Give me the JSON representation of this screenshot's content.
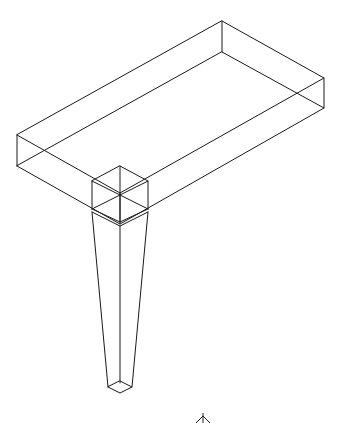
{
  "drawing": {
    "type": "isometric-wireframe",
    "subject": "table slab with tapered leg",
    "line_color": "#1a1a1a",
    "background": "#ffffff",
    "faint_label": "",
    "slab": {
      "top_face": [
        [
          222,
          21
        ],
        [
          324,
          78
        ],
        [
          120,
          193
        ],
        [
          17,
          135
        ]
      ],
      "bottom_face": [
        [
          222,
          52
        ],
        [
          324,
          108
        ],
        [
          120,
          224
        ],
        [
          17,
          166
        ]
      ]
    },
    "leg_block": {
      "top_face": [
        [
          120,
          166
        ],
        [
          148,
          181
        ],
        [
          120,
          195
        ],
        [
          92,
          181
        ]
      ],
      "bottom_face": [
        [
          120,
          194
        ],
        [
          148,
          209
        ],
        [
          120,
          222
        ],
        [
          92,
          209
        ]
      ]
    },
    "leg_taper": {
      "top": [
        [
          92,
          212
        ],
        [
          120,
          226
        ],
        [
          148,
          212
        ]
      ],
      "bottom": [
        [
          108,
          387
        ],
        [
          120,
          383
        ],
        [
          132,
          387
        ],
        [
          120,
          392
        ]
      ]
    },
    "bottom_marker": {
      "position": [
        203,
        418
      ]
    }
  }
}
